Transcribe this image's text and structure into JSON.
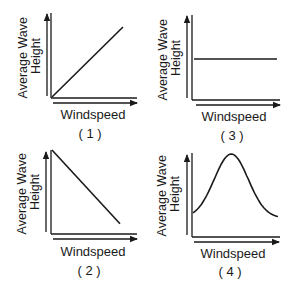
{
  "graphs": [
    {
      "id": "1",
      "number_label": "( 1 )",
      "x_label": "Windspeed",
      "y_label_line1": "Average Wave",
      "y_label_line2": "Height",
      "relationship": "direct-linear",
      "points": [
        [
          0,
          0
        ],
        [
          1,
          1
        ]
      ]
    },
    {
      "id": "2",
      "number_label": "( 2 )",
      "x_label": "Windspeed",
      "y_label_line1": "Average Wave",
      "y_label_line2": "Height",
      "relationship": "inverse-linear",
      "points": [
        [
          0,
          1
        ],
        [
          1,
          0.1
        ]
      ]
    },
    {
      "id": "3",
      "number_label": "( 3 )",
      "x_label": "Windspeed",
      "y_label_line1": "Average Wave",
      "y_label_line2": "Height",
      "relationship": "constant",
      "points": [
        [
          0,
          0.5
        ],
        [
          1,
          0.5
        ]
      ]
    },
    {
      "id": "4",
      "number_label": "( 4 )",
      "x_label": "Windspeed",
      "y_label_line1": "Average Wave",
      "y_label_line2": "Height",
      "relationship": "bell-curve",
      "points": [
        [
          0,
          0.2
        ],
        [
          0.45,
          1
        ],
        [
          1,
          0.2
        ]
      ]
    }
  ],
  "colors": {
    "ink": "#1a1a1a",
    "background": "#ffffff"
  }
}
